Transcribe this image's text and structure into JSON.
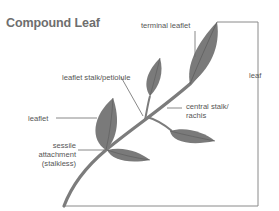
{
  "title": "Compound Leaf",
  "labels": {
    "terminal_leaflet": "terminal leaflet",
    "leaf": "leaf",
    "leaflet_stalk": "leaflet stalk/petiolule",
    "central_stalk_line1": "central stalk/",
    "central_stalk_line2": "rachis",
    "leaflet": "leaflet",
    "sessile_line1": "sessile",
    "sessile_line2": "attachment",
    "sessile_line3": "(stalkless)"
  },
  "colors": {
    "leaf_fill": "#7a7a7a",
    "leaf_vein": "#5a5a5a",
    "stem": "#7c7c7c",
    "leader_line": "#6a6a6a",
    "title": "#6e6e6e",
    "text": "#555555"
  }
}
